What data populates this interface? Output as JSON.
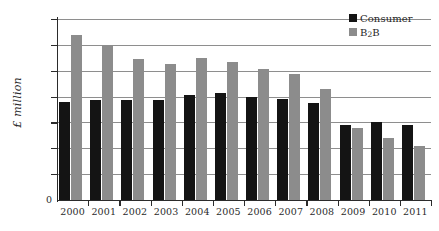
{
  "chart_data": {
    "type": "bar",
    "title": "",
    "subtitle": "",
    "xlabel": "",
    "ylabel": "£ million",
    "categories": [
      "2000",
      "2001",
      "2002",
      "2003",
      "2004",
      "2005",
      "2006",
      "2007",
      "2008",
      "2009",
      "2010",
      "2011"
    ],
    "series": [
      {
        "name": "Consumer",
        "color": "#141414",
        "values": [
          755,
          770,
          770,
          770,
          810,
          825,
          795,
          785,
          750,
          580,
          600,
          580
        ]
      },
      {
        "name": "B2B",
        "color": "#8c8c8c",
        "values": [
          1275,
          1200,
          1090,
          1050,
          1095,
          1070,
          1010,
          975,
          855,
          555,
          480,
          415
        ]
      }
    ],
    "ylim": [
      0,
      1400
    ],
    "ytick_values": [
      0,
      200,
      400,
      600,
      800,
      1000,
      1200,
      1400
    ],
    "ytick_labels": [
      "0",
      "200",
      "400",
      "600",
      "800",
      "1000",
      "1200",
      "1400"
    ],
    "grid": true,
    "grid_axis": "y",
    "legend_position": "top-right",
    "zero_label": "0"
  },
  "legend": {
    "items": [
      {
        "label": "Consumer",
        "label_main": "Consumer",
        "label_sub": "",
        "label_tail": "",
        "color": "#141414"
      },
      {
        "label": "B2B",
        "label_main": "B",
        "label_sub": "2",
        "label_tail": "B",
        "color": "#8c8c8c"
      }
    ]
  },
  "colors": {
    "consumer": "#141414",
    "b2b": "#8c8c8c",
    "axis": "#2b2b2b",
    "grid": "#8e8e8e",
    "background": "#ffffff"
  }
}
